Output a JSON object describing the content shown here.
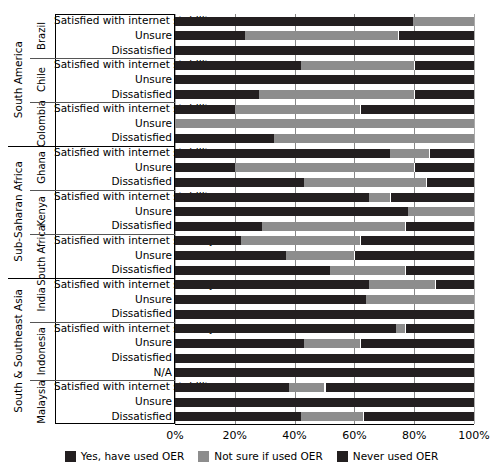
{
  "chart_data": {
    "type": "bar",
    "subtype": "stacked-horizontal-100percent",
    "title": "",
    "xlabel": "",
    "ylabel": "",
    "xlim": [
      0,
      100
    ],
    "xticks": [
      "0%",
      "20%",
      "40%",
      "60%",
      "80%",
      "100%"
    ],
    "xtick_values": [
      0,
      20,
      40,
      60,
      80,
      100
    ],
    "grid": true,
    "legend_position": "bottom-center",
    "series": [
      {
        "name": "Yes, have used OER",
        "color": "#231f20"
      },
      {
        "name": "Not sure if used OER",
        "color": "#8d8d8d"
      },
      {
        "name": "Never used OER",
        "color": "#231f20"
      }
    ],
    "categories": [
      "Satisfied with internet stability",
      "Unsure",
      "Dissatisfied",
      "N/A"
    ],
    "regions": [
      {
        "region": "South America",
        "countries": [
          {
            "country": "Brazil",
            "rows": [
              {
                "label": "Satisfied with internet stability",
                "values": [
                  79.6,
                  20.4,
                  0.0
                ]
              },
              {
                "label": "Unsure",
                "values": [
                  23.4,
                  51.2,
                  25.4
                ]
              },
              {
                "label": "Dissatisfied",
                "values": [
                  100.0,
                  0.0,
                  0.0
                ]
              }
            ]
          },
          {
            "country": "Chile",
            "rows": [
              {
                "label": "Satisfied with internet stability",
                "values": [
                  42.0,
                  38.0,
                  20.0
                ]
              },
              {
                "label": "Unsure",
                "values": [
                  100.0,
                  0.0,
                  0.0
                ]
              },
              {
                "label": "Dissatisfied",
                "values": [
                  28.0,
                  52.0,
                  20.0
                ]
              }
            ]
          },
          {
            "country": "Colombia",
            "rows": [
              {
                "label": "Satisfied with internet stability",
                "values": [
                  20.0,
                  42.0,
                  38.0
                ]
              },
              {
                "label": "Unsure",
                "values": [
                  0.0,
                  100.0,
                  0.0
                ]
              },
              {
                "label": "Dissatisfied",
                "values": [
                  33.0,
                  67.0,
                  0.0
                ]
              }
            ]
          }
        ]
      },
      {
        "region": "Sub-Saharan Africa",
        "countries": [
          {
            "country": "Ghana",
            "rows": [
              {
                "label": "Satisfied with internet stability",
                "values": [
                  72.0,
                  13.0,
                  15.0
                ]
              },
              {
                "label": "Unsure",
                "values": [
                  20.0,
                  60.0,
                  20.0
                ]
              },
              {
                "label": "Dissatisfied",
                "values": [
                  43.0,
                  41.0,
                  16.0
                ]
              }
            ]
          },
          {
            "country": "Kenya",
            "rows": [
              {
                "label": "Satisfied with internet stability",
                "values": [
                  65.0,
                  7.0,
                  28.0
                ]
              },
              {
                "label": "Unsure",
                "values": [
                  78.0,
                  22.0,
                  0.0
                ]
              },
              {
                "label": "Dissatisfied",
                "values": [
                  29.0,
                  48.0,
                  23.0
                ]
              }
            ]
          },
          {
            "country": "South Africa",
            "rows": [
              {
                "label": "Satisfied with internet stability",
                "values": [
                  22.0,
                  40.0,
                  38.0
                ]
              },
              {
                "label": "Unsure",
                "values": [
                  37.0,
                  23.0,
                  40.0
                ]
              },
              {
                "label": "Dissatisfied",
                "values": [
                  52.0,
                  25.0,
                  23.0
                ]
              }
            ]
          }
        ]
      },
      {
        "region": "South & Southeast Asia",
        "countries": [
          {
            "country": "India",
            "rows": [
              {
                "label": "Satisfied with internet stability",
                "values": [
                  65.0,
                  22.0,
                  13.0
                ]
              },
              {
                "label": "Unsure",
                "values": [
                  64.0,
                  36.0,
                  0.0
                ]
              },
              {
                "label": "Dissatisfied",
                "values": [
                  100.0,
                  0.0,
                  0.0
                ]
              }
            ]
          },
          {
            "country": "Indonesia",
            "rows": [
              {
                "label": "Satisfied with internet stability",
                "values": [
                  74.0,
                  3.0,
                  23.0
                ]
              },
              {
                "label": "Unsure",
                "values": [
                  43.0,
                  19.0,
                  38.0
                ]
              },
              {
                "label": "Dissatisfied",
                "values": [
                  100.0,
                  0.0,
                  0.0
                ]
              },
              {
                "label": "N/A",
                "values": [
                  100.0,
                  0.0,
                  0.0
                ]
              }
            ]
          },
          {
            "country": "Malaysia",
            "rows": [
              {
                "label": "Satisfied with internet stability",
                "values": [
                  38.0,
                  12.0,
                  50.0
                ]
              },
              {
                "label": "Unsure",
                "values": [
                  100.0,
                  0.0,
                  0.0
                ]
              },
              {
                "label": "Dissatisfied",
                "values": [
                  42.0,
                  21.0,
                  37.0
                ]
              }
            ]
          }
        ]
      }
    ]
  },
  "legend": {
    "items": [
      {
        "label": "Yes, have used OER",
        "color": "#231f20"
      },
      {
        "label": "Not sure if used OER",
        "color": "#8d8d8d"
      },
      {
        "label": "Never used OER",
        "color": "#231f20"
      }
    ]
  },
  "axis": {
    "ticks": [
      "0%",
      "20%",
      "40%",
      "60%",
      "80%",
      "100%"
    ]
  }
}
